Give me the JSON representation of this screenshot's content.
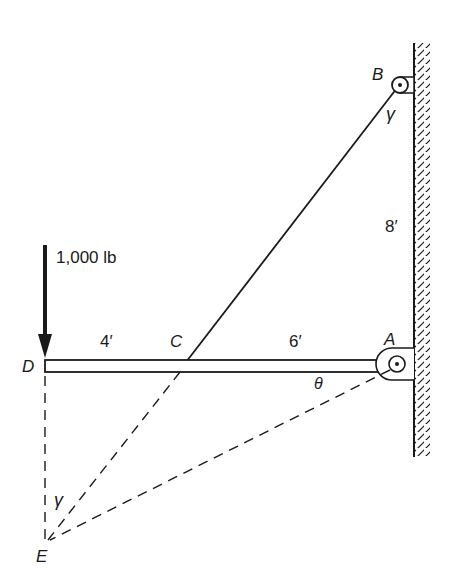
{
  "figure": {
    "type": "static-structure-diagram"
  },
  "labels": {
    "point_A": "A",
    "point_B": "B",
    "point_C": "C",
    "point_D": "D",
    "point_E": "E",
    "load": "1,000 lb",
    "dim_DC": "4′",
    "dim_CA": "6′",
    "dim_AB": "8′",
    "angle_gamma_B": "γ",
    "angle_gamma_E": "γ",
    "angle_theta": "θ"
  },
  "geometry": {
    "DC_ft": 4,
    "CA_ft": 6,
    "AB_ft": 8,
    "load_lb": 1000
  },
  "colors": {
    "line": "#1a1a1a",
    "background": "#ffffff"
  }
}
